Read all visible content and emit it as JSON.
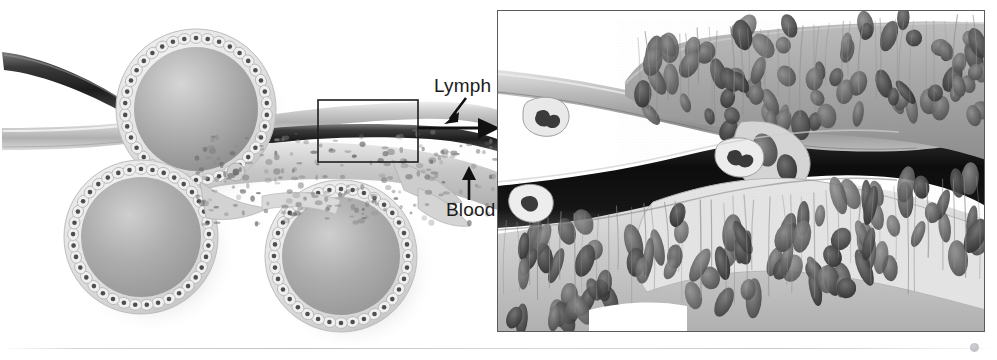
{
  "figure": {
    "style": "grayscale scientific line-and-tone illustration",
    "background_color": "#ffffff",
    "width": 997,
    "height": 360
  },
  "annotations": {
    "lymph_label": "Lymph",
    "blood_label": "Blood",
    "lymph_arrow": "arrow-down-left-icon",
    "blood_arrow": "arrow-up-icon",
    "flow_arrow": "arrow-right-icon"
  },
  "left_panel": {
    "name": "overview-diagram",
    "alveoli": [
      {
        "id": "alveolus-top",
        "cx": 196,
        "cy": 109,
        "r": 80,
        "cell_count": 38
      },
      {
        "id": "alveolus-left",
        "cx": 141,
        "cy": 237,
        "r": 77,
        "cell_count": 37
      },
      {
        "id": "alveolus-right",
        "cx": 341,
        "cy": 256,
        "r": 76,
        "cell_count": 36
      }
    ],
    "vessels": [
      {
        "id": "blood-vessel",
        "tone": "dark",
        "color": "#3a3a3a"
      },
      {
        "id": "lymph-vessel",
        "tone": "light",
        "color": "#b9b9b9"
      }
    ],
    "selection_rect": {
      "name": "magnification-selection-rect",
      "x": 318,
      "y": 100,
      "width": 100,
      "height": 62,
      "stroke": "#1d1d1d"
    }
  },
  "right_panel": {
    "name": "magnified-inset",
    "border_color": "#5b5b5b",
    "x": 497,
    "y": 10,
    "width": 488,
    "height": 322,
    "regions": [
      {
        "id": "upper-epithelium",
        "description": "dense cuboidal epithelium with oval nuclei"
      },
      {
        "id": "lymph-channel",
        "description": "pale lymphatic lumen with leukocytes"
      },
      {
        "id": "blood-channel",
        "description": "dark blood lumen",
        "color": "#111111"
      },
      {
        "id": "lower-epithelium",
        "description": "columnar epithelium with elongated nuclei"
      }
    ],
    "leukocytes": 3
  },
  "colors": {
    "ink": "#1b1b1b",
    "border": "#5b5b5b",
    "tissue_light": "#dedede",
    "tissue_mid": "#a8a8a8",
    "tissue_dark": "#6e6e6e",
    "lumen_dark": "#111111",
    "background": "#ffffff"
  }
}
